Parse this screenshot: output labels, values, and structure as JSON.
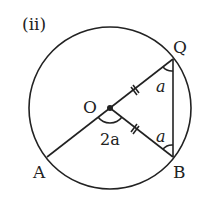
{
  "diagram": {
    "part_label": "(ii)",
    "points": {
      "O": {
        "label": "O",
        "x": 110,
        "y": 108
      },
      "Q": {
        "label": "Q",
        "x": 173,
        "y": 59
      },
      "B": {
        "label": "B",
        "x": 173,
        "y": 157
      },
      "A": {
        "label": "A",
        "x": 47,
        "y": 157
      }
    },
    "angles": {
      "at_Q": "a",
      "at_B": "a",
      "at_O": "2a"
    },
    "colors": {
      "stroke": "#222222",
      "background": "#ffffff"
    }
  }
}
